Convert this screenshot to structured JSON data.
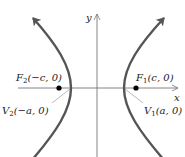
{
  "diagram": {
    "type": "hyperbola",
    "orientation": "horizontal transverse axis",
    "axes": {
      "x_label": "x",
      "y_label": "y"
    },
    "points": [
      {
        "id": "F2",
        "label": "F",
        "sub": "2",
        "coords": "(−c, 0)",
        "kind": "focus"
      },
      {
        "id": "F1",
        "label": "F",
        "sub": "1",
        "coords": "(c, 0)",
        "kind": "focus"
      },
      {
        "id": "V2",
        "label": "V",
        "sub": "2",
        "coords": "(−a, 0)",
        "kind": "vertex"
      },
      {
        "id": "V1",
        "label": "V",
        "sub": "1",
        "coords": "(a, 0)",
        "kind": "vertex"
      }
    ],
    "colors": {
      "curve": "#555555",
      "axis": "#777777",
      "point": "#000000",
      "text": "#222222"
    }
  }
}
